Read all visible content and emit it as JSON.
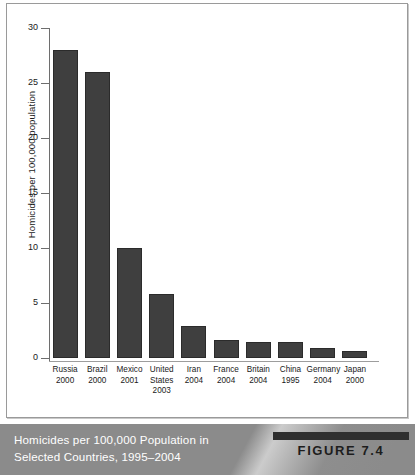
{
  "figure": {
    "caption_line_1": "Homicides per 100,000 Population in",
    "caption_line_2": "Selected Countries, 1995–2004",
    "badge_label": "FIGURE 7.4",
    "badge_color": "#2f2f2f",
    "caption_band_color": "#8b8b8b",
    "caption_text_color": "#ffffff"
  },
  "chart_data": {
    "type": "bar",
    "title": "Homicides per 100,000 Population in Selected Countries, 1995–2004",
    "xlabel": "",
    "ylabel": "Homicides per 100,000 population",
    "ylim": [
      0,
      30
    ],
    "yticks": [
      0,
      5,
      10,
      15,
      20,
      25,
      30
    ],
    "ytick_labels": [
      "0",
      "5",
      "10",
      "15",
      "20",
      "25",
      "30"
    ],
    "grid": false,
    "legend": "none",
    "bar_color": "#3f3f3f",
    "categories": [
      "Russia",
      "Brazil",
      "Mexico",
      "United States",
      "Iran",
      "France",
      "Britain",
      "China",
      "Germany",
      "Japan"
    ],
    "category_lines": [
      [
        "Russia",
        "2000"
      ],
      [
        "Brazil",
        "2000"
      ],
      [
        "Mexico",
        "2001"
      ],
      [
        "United",
        "States",
        "2003"
      ],
      [
        "Iran",
        "2004"
      ],
      [
        "France",
        "2004"
      ],
      [
        "Britain",
        "2004"
      ],
      [
        "China",
        "1995"
      ],
      [
        "Germany",
        "2004"
      ],
      [
        "Japan",
        "2000"
      ]
    ],
    "years": [
      "2000",
      "2000",
      "2001",
      "2003",
      "2004",
      "2004",
      "2004",
      "1995",
      "2004",
      "2000"
    ],
    "values": [
      28.0,
      26.0,
      10.0,
      5.8,
      2.9,
      1.6,
      1.5,
      1.5,
      0.9,
      0.6
    ]
  }
}
